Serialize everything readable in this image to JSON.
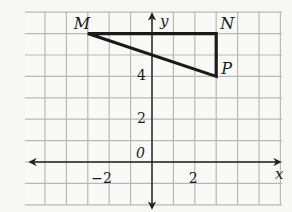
{
  "figure": {
    "type": "coordinate-grid-triangle",
    "grid": {
      "x_min": -6,
      "x_max": 6,
      "y_min": -2,
      "y_max": 7,
      "origin_px": [
        152,
        162
      ],
      "cell_px": 21.4,
      "left_px": 25,
      "top_px": 12,
      "right_px": 282,
      "bottom_px": 205,
      "line_color": "#b8b8b8",
      "axis_color": "#222222"
    },
    "axes": {
      "x_label": "x",
      "y_label": "y",
      "origin_label": "0",
      "x_tick_labels": [
        {
          "value": -2,
          "label": "−2"
        },
        {
          "value": 2,
          "label": "2"
        }
      ],
      "y_tick_labels": [
        {
          "value": 2,
          "label": "2"
        },
        {
          "value": 4,
          "label": "4"
        }
      ]
    },
    "triangle": {
      "stroke_color": "#1a1a1a",
      "vertices": [
        {
          "name": "M",
          "x": -3,
          "y": 6
        },
        {
          "name": "N",
          "x": 3,
          "y": 6
        },
        {
          "name": "P",
          "x": 3,
          "y": 4
        }
      ]
    }
  }
}
